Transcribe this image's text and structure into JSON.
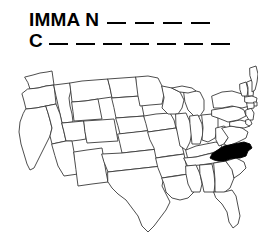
{
  "puzzle": {
    "line1": {
      "prefix": "IMMA  N",
      "blank_count": 4
    },
    "line2": {
      "prefix": "C",
      "blank_count": 7
    },
    "text_color": "#000000"
  },
  "map": {
    "title": "United States outline map",
    "highlighted_state": "North Carolina",
    "highlight_color": "#000000",
    "state_fill_color": "#ffffff",
    "border_color": "#3a3a3a",
    "background_color": "#ffffff"
  }
}
